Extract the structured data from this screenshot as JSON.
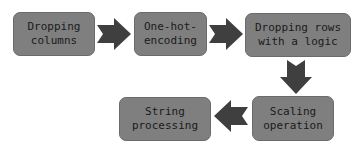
{
  "diagram": {
    "type": "flowchart",
    "colors": {
      "box_fill": "#7f7f7f",
      "box_border": "#6b6b6b",
      "arrow_fill": "#3f3f3f",
      "text": "#1a1a1a",
      "background": "#ffffff"
    },
    "nodes": [
      {
        "id": "n1",
        "label": "Dropping columns"
      },
      {
        "id": "n2",
        "label": "One-hot-encoding"
      },
      {
        "id": "n3",
        "label": "Dropping rows with a logic"
      },
      {
        "id": "n4",
        "label": "Scaling operation"
      },
      {
        "id": "n5",
        "label": "String processing"
      }
    ],
    "edges": [
      {
        "from": "n1",
        "to": "n2",
        "direction": "right"
      },
      {
        "from": "n2",
        "to": "n3",
        "direction": "right"
      },
      {
        "from": "n3",
        "to": "n4",
        "direction": "down"
      },
      {
        "from": "n4",
        "to": "n5",
        "direction": "left"
      }
    ],
    "labels": {
      "n1_line1": "Dropping",
      "n1_line2": "columns",
      "n2_line1": "One-hot-",
      "n2_line2": "encoding",
      "n3_line1": "Dropping rows",
      "n3_line2": "with a logic",
      "n4_line1": "Scaling",
      "n4_line2": "operation",
      "n5_line1": "String",
      "n5_line2": "processing"
    }
  }
}
